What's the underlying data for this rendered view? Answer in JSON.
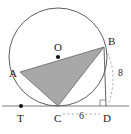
{
  "figure": {
    "background": "#ffffff",
    "stroke_color": "#4a4a4a",
    "triangle_fill": "#a8a8a8",
    "dash_color": "#9a9a9a",
    "point_color": "#111111",
    "width": 131,
    "height": 134
  },
  "circle": {
    "center_x": 58,
    "center_y": 57,
    "radius": 49,
    "center_label": "O"
  },
  "points": {
    "A": {
      "label": "A",
      "x": 20,
      "y": 72,
      "label_x": 9,
      "label_y": 77
    },
    "B": {
      "label": "B",
      "x": 104,
      "y": 47,
      "label_x": 108,
      "label_y": 45
    },
    "C": {
      "label": "C",
      "x": 58,
      "y": 106,
      "label_x": 54,
      "label_y": 122
    },
    "D": {
      "label": "D",
      "x": 106,
      "y": 106,
      "label_x": 103,
      "label_y": 122
    },
    "O": {
      "label": "O",
      "x": 58,
      "y": 57,
      "label_x": 54,
      "label_y": 51
    },
    "T": {
      "label": "T",
      "x": 21,
      "y": 106,
      "label_x": 17,
      "label_y": 122
    }
  },
  "segments": {
    "tangent_line": {
      "name": "tangent-line-TD",
      "x1": 2,
      "y1": 106,
      "x2": 129,
      "y2": 106
    },
    "chord_AB": {
      "name": "chord-AB"
    },
    "chord_BC": {
      "name": "chord-BC"
    },
    "chord_AC": {
      "name": "chord-AC"
    },
    "segment_BD": {
      "name": "segment-BD",
      "x1": 104,
      "y1": 47,
      "x2": 106,
      "y2": 106
    }
  },
  "measures": {
    "bd_length": "8",
    "bd_label_x": 118,
    "bd_label_y": 76,
    "cd_length": "6",
    "cd_label_x": 82,
    "cd_label_y": 120
  },
  "right_angle": {
    "name": "right-angle-marker-at-D",
    "x": 100,
    "y": 100,
    "size": 6
  }
}
